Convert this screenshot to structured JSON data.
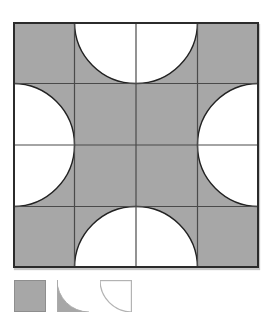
{
  "canvas": {
    "width": 275,
    "height": 318,
    "background": "#ffffff"
  },
  "figure": {
    "rows": 4,
    "cols": 4,
    "cell_px": 61.5,
    "fill": "#a7a7a7",
    "hole_fill": "#ffffff",
    "grid_line_color": "#4a4a4a",
    "grid_line_width": 1.2,
    "arc_stroke": "#222222",
    "arc_stroke_width": 1.4,
    "border_color": "#2b2b2b",
    "border_width": 2,
    "radius_cells": 1,
    "semicircles": [
      {
        "edge": "top",
        "center": [
          2,
          0
        ]
      },
      {
        "edge": "left",
        "center": [
          0,
          2
        ]
      },
      {
        "edge": "right",
        "center": [
          4,
          2
        ]
      },
      {
        "edge": "bottom",
        "center": [
          2,
          4
        ]
      }
    ]
  },
  "legend": {
    "items": [
      {
        "name": "shaded-square",
        "type": "filled-square",
        "fill": "#a7a7a7",
        "stroke": "#8e8e8e",
        "bg": "#ffffff"
      },
      {
        "name": "concave-corner-piece",
        "type": "concave-corner",
        "fill": "#a7a7a7",
        "stroke": "#ababab",
        "bg": "#ffffff"
      },
      {
        "name": "quarter-circle-piece",
        "type": "quarter-circle",
        "fill": "#ffffff",
        "stroke": "#b3b3b3",
        "bg": "#ffffff"
      }
    ]
  }
}
